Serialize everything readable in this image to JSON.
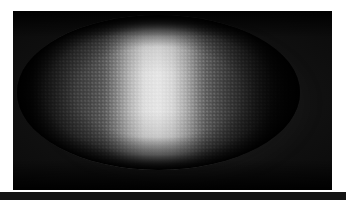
{
  "figure": {
    "width": 346,
    "height": 200,
    "background_color": "#ffffff",
    "caption": "",
    "annotations": []
  },
  "plate": {
    "name": "micrograph-plate",
    "x": 13,
    "y": 11,
    "width": 319,
    "height": 179,
    "background_color": "#060606",
    "border_color": "#141414"
  },
  "specimen": {
    "label": "",
    "shape": "ellipse",
    "center_x": 158,
    "center_y": 92,
    "width": 283,
    "height": 155,
    "texture": "nuclear-honeycomb",
    "nucleus_pitch_px": 3.6
  },
  "chart_data": {
    "type": "heatmap",
    "title": "",
    "subtitle": "",
    "xlabel": "",
    "ylabel": "",
    "colormap": "grayscale",
    "grid": false,
    "legend_position": "none",
    "x": [
      0,
      5,
      10,
      15,
      20,
      25,
      30,
      35,
      40,
      45,
      50,
      55,
      60,
      65,
      70,
      75,
      80,
      85,
      90,
      95,
      100
    ],
    "xlim": [
      0,
      100
    ],
    "ylim": [
      0,
      255
    ],
    "tick_labels_x": [],
    "tick_labels_y": [],
    "series": [
      {
        "name": "midline-intensity-profile",
        "values": [
          5,
          13,
          36,
          58,
          78,
          94,
          118,
          158,
          200,
          230,
          236,
          224,
          189,
          142,
          106,
          76,
          52,
          31,
          14,
          7,
          5
        ]
      },
      {
        "name": "dorsal-intensity-profile",
        "values": [
          4,
          9,
          24,
          40,
          55,
          66,
          83,
          112,
          142,
          163,
          168,
          159,
          134,
          101,
          75,
          54,
          37,
          22,
          10,
          5,
          4
        ]
      },
      {
        "name": "ventral-intensity-profile",
        "values": [
          4,
          10,
          26,
          43,
          59,
          71,
          89,
          120,
          152,
          175,
          180,
          170,
          143,
          108,
          80,
          58,
          39,
          23,
          11,
          5,
          4
        ]
      }
    ],
    "annotations": []
  }
}
